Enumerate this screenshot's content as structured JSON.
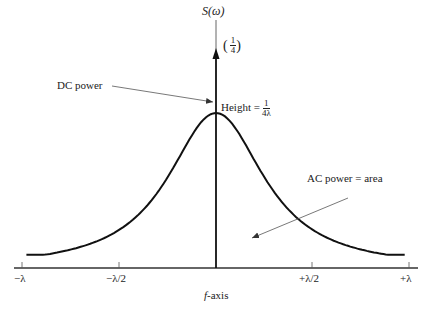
{
  "figure": {
    "y_axis_label": "S(ω)",
    "impulse_label": {
      "open": "(",
      "num": "1",
      "den": "4",
      "close": ")"
    },
    "x_axis_label": {
      "var": "f",
      "suffix": "-axis"
    },
    "annotations": {
      "dc_power": "DC power",
      "height_label": "Height =",
      "height_num": "1",
      "height_den": "4λ",
      "ac_power": "AC power = area"
    },
    "x_ticks": [
      "−λ",
      "−λ/2",
      "+λ/2",
      "+λ"
    ]
  },
  "chart_data": {
    "type": "line",
    "title": "",
    "xlabel": "f-axis",
    "ylabel": "S(ω)",
    "x_ticks": [
      "−λ",
      "−λ/2",
      "0",
      "+λ/2",
      "+λ"
    ],
    "xlim": [
      "-λ",
      "+λ"
    ],
    "series": [
      {
        "name": "continuous PSD (AC power)",
        "x_units_lambda": [
          -1.0,
          -0.75,
          -0.5,
          -0.4,
          -0.3,
          -0.2,
          -0.1,
          0,
          0.1,
          0.2,
          0.3,
          0.4,
          0.5,
          0.75,
          1.0
        ],
        "relative_height": [
          0.09,
          0.15,
          0.27,
          0.37,
          0.5,
          0.69,
          0.9,
          1.0,
          0.9,
          0.69,
          0.5,
          0.37,
          0.27,
          0.15,
          0.09
        ],
        "peak_value": "1/(4λ)"
      },
      {
        "name": "DC impulse",
        "x_units_lambda": [
          0
        ],
        "weight": "1/4"
      }
    ],
    "annotations": [
      "DC power",
      "Height = 1/(4λ)",
      "AC power = area",
      "(1/4)"
    ],
    "grid": false,
    "legend": false
  }
}
